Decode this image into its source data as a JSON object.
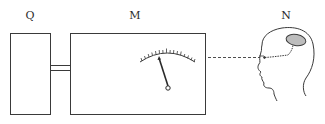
{
  "diagram": {
    "labels": {
      "q": "Q",
      "m": "M",
      "n": "N"
    },
    "components": [
      {
        "id": "Q",
        "description": "rectangular box"
      },
      {
        "id": "M",
        "description": "rectangular box with analog meter dial and needle"
      },
      {
        "id": "N",
        "description": "human head profile with shaded brain region"
      }
    ],
    "connections": [
      {
        "from": "Q",
        "to": "M",
        "style": "double-line connector"
      },
      {
        "from": "M",
        "to": "N",
        "style": "dashed line to eye"
      }
    ],
    "colors": {
      "stroke": "#3a3a3a",
      "brain_fill": "#bdbdbd",
      "background": "#ffffff"
    }
  }
}
